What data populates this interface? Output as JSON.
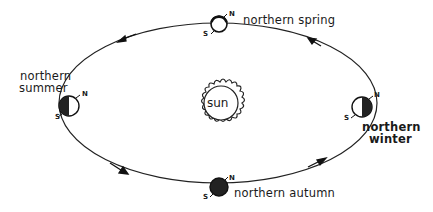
{
  "diagram": {
    "center": {
      "label": "sun"
    },
    "orbit": {
      "direction": "counterclockwise",
      "stroke": "#222222"
    },
    "positions": [
      {
        "id": "spring",
        "label": "northern spring",
        "north": "N",
        "south": "S"
      },
      {
        "id": "summer",
        "label_lines": [
          "northern",
          "summer"
        ],
        "north": "N",
        "south": "S"
      },
      {
        "id": "winter",
        "label_lines": [
          "northern",
          "winter"
        ],
        "north": "N",
        "south": "S"
      },
      {
        "id": "autumn",
        "label": "northern autumn",
        "north": "N",
        "south": "S"
      }
    ],
    "colors": {
      "ink": "#1a1a1a",
      "background": "#ffffff"
    }
  }
}
